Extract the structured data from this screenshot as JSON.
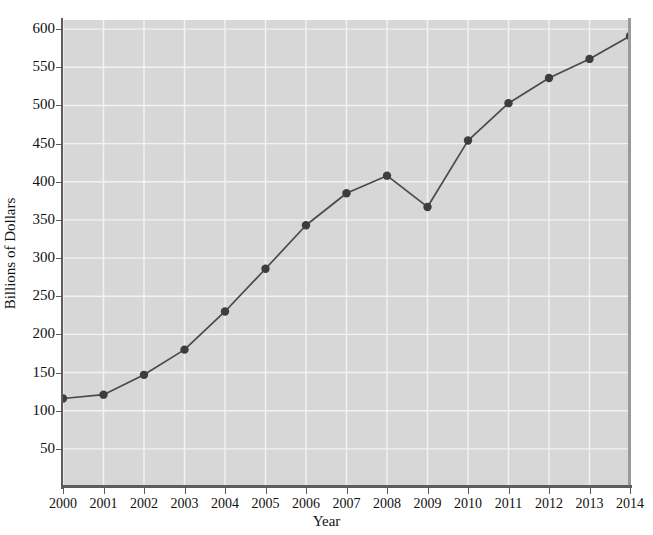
{
  "chart_data": {
    "type": "line",
    "title": "",
    "xlabel": "Year",
    "ylabel": "Billions of Dollars",
    "x": [
      2000,
      2001,
      2002,
      2003,
      2004,
      2005,
      2006,
      2007,
      2008,
      2009,
      2010,
      2011,
      2012,
      2013,
      2014
    ],
    "values": [
      116,
      121,
      147,
      180,
      230,
      286,
      343,
      385,
      408,
      367,
      454,
      503,
      536,
      561,
      591
    ],
    "series": [
      {
        "name": "Billions of Dollars",
        "values": [
          116,
          121,
          147,
          180,
          230,
          286,
          343,
          385,
          408,
          367,
          454,
          503,
          536,
          561,
          591
        ]
      }
    ],
    "xlim": [
      2000,
      2014
    ],
    "ylim": [
      0,
      612
    ],
    "ytick_labels": [
      "50",
      "100",
      "150",
      "200",
      "250",
      "300",
      "350",
      "400",
      "450",
      "500",
      "550",
      "600"
    ],
    "ytick_values": [
      50,
      100,
      150,
      200,
      250,
      300,
      350,
      400,
      450,
      500,
      550,
      600
    ],
    "xtick_labels": [
      "2000",
      "2001",
      "2002",
      "2003",
      "2004",
      "2005",
      "2006",
      "2007",
      "2008",
      "2009",
      "2010",
      "2011",
      "2012",
      "2013",
      "2014"
    ],
    "grid": true,
    "legend": null,
    "colors": {
      "plot_background": "#d7d7d7",
      "page_background": "#ffffff",
      "gridline": "#f2f2f2",
      "line": "#4a4a4a",
      "marker": "#3d3d3d",
      "axis": "#5d5d5d",
      "text": "#111111"
    }
  }
}
